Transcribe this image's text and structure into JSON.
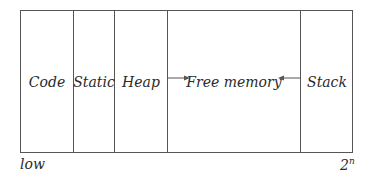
{
  "diagram": {
    "title": "",
    "segments": [
      {
        "label": "Code"
      },
      {
        "label": "Static"
      },
      {
        "label": "Heap"
      },
      {
        "label": "Free memory"
      },
      {
        "label": "Stack"
      }
    ],
    "axis": {
      "low_label": "low",
      "high_base": "2",
      "high_exp": "n"
    },
    "arrows": [
      {
        "from": "Heap",
        "to": "Free memory",
        "direction": "right"
      },
      {
        "from": "Stack",
        "to": "Free memory",
        "direction": "left"
      }
    ]
  }
}
